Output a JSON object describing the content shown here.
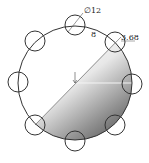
{
  "diagram": {
    "type": "bolt-circle",
    "labels": {
      "hole_diameter": "∅12",
      "hole_count": "8",
      "offset_value": "3.68"
    },
    "main_circle": {
      "cx": 75,
      "cy": 83,
      "r": 57
    },
    "holes": [
      {
        "cx": 75,
        "cy": 25
      },
      {
        "cx": 115,
        "cy": 42
      },
      {
        "cx": 132,
        "cy": 84
      },
      {
        "cx": 115,
        "cy": 125
      },
      {
        "cx": 75,
        "cy": 141
      },
      {
        "cx": 35,
        "cy": 125
      },
      {
        "cx": 18,
        "cy": 82
      },
      {
        "cx": 35,
        "cy": 41
      }
    ],
    "hole_radius": 10,
    "colors": {
      "stroke": "#333333",
      "shade_dark": "#5a5a5a",
      "shade_light": "#ffffff"
    }
  }
}
